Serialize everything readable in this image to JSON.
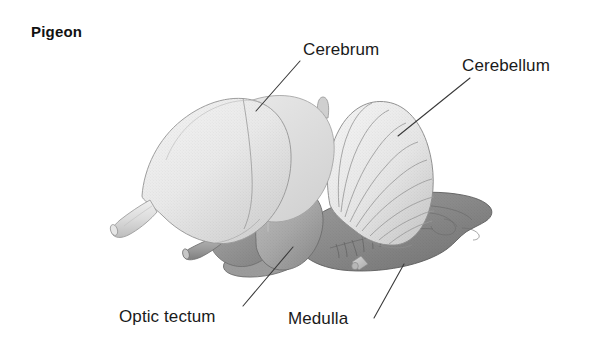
{
  "figure": {
    "title": "Pigeon",
    "background_color": "#ffffff",
    "text_color": "#1a1a1a"
  },
  "labels": [
    {
      "id": "cerebrum",
      "text": "Cerebrum",
      "leader_from": [
        300,
        61
      ],
      "leader_to": [
        256,
        111
      ]
    },
    {
      "id": "cerebellum",
      "text": "Cerebellum",
      "leader_from": [
        470,
        78
      ],
      "leader_to": [
        398,
        136
      ]
    },
    {
      "id": "optic-tectum",
      "text": "Optic tectum",
      "leader_from": [
        243,
        306
      ],
      "leader_to": [
        293,
        247
      ]
    },
    {
      "id": "medulla",
      "text": "Medulla",
      "leader_from": [
        374,
        318
      ],
      "leader_to": [
        404,
        264
      ]
    }
  ],
  "structures": [
    {
      "name": "cerebrum",
      "label": "Cerebrum",
      "fill": "#e8e8e8",
      "shade": "#d4d4d4",
      "outline": "#9a9a9a",
      "note": "large smooth light-gray hemisphere, upper-left mass"
    },
    {
      "name": "olfactory-bulb-stalk",
      "label": "Olfactory bulb",
      "fill": "#e4e4e4",
      "outline": "#9a9a9a",
      "note": "small light tube projecting lower-left from cerebrum"
    },
    {
      "name": "cerebellum",
      "label": "Cerebellum",
      "fill": "#eaeaea",
      "shade": "#d0d0d0",
      "outline": "#8f8f8f",
      "folia_count": 9,
      "note": "fan-shaped shell with radial folia lines, upper-right"
    },
    {
      "name": "pineal-nub",
      "label": "Pineal",
      "fill": "#cfcfcf",
      "outline": "#9a9a9a",
      "note": "small vertical nub between cerebrum and cerebellum"
    },
    {
      "name": "optic-tectum",
      "label": "Optic tectum",
      "fill": "#a9a9a9",
      "shade": "#8d8d8d",
      "outline": "#6f6f6f",
      "note": "medium-gray rounded lobe, lower middle"
    },
    {
      "name": "optic-nerve-stub",
      "label": "Optic nerve",
      "fill": "#9d9d9d",
      "outline": "#6f6f6f",
      "note": "medium-gray tube projecting lower-left"
    },
    {
      "name": "pituitary-disc",
      "label": "Pituitary",
      "fill": "#9a9a9a",
      "outline": "#6f6f6f",
      "note": "flat elliptical disc under optic tectum"
    },
    {
      "name": "medulla",
      "label": "Medulla",
      "fill": "#8b8b8b",
      "shade": "#757575",
      "outline": "#5c5c5c",
      "note": "dark-gray elongated brainstem extending to lower right, with cranial nerve roots"
    },
    {
      "name": "cranial-nerve-stub",
      "label": "Cranial nerve",
      "fill": "#c2c2c2",
      "outline": "#8a8a8a",
      "note": "small pale rod hanging below medulla"
    }
  ],
  "leader_line": {
    "color": "#3a3a3a",
    "width": 1.1
  }
}
